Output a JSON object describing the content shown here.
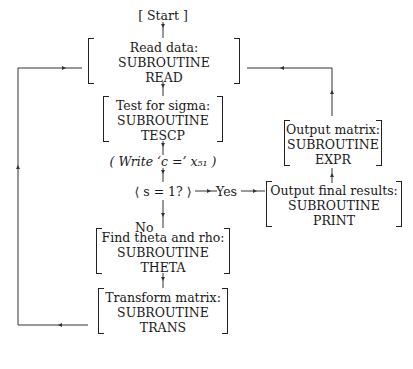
{
  "diagram": {
    "start": "[ Start ]",
    "nodes": [
      {
        "id": "read",
        "lines": [
          "Read data:",
          "SUBROUTINE",
          "READ"
        ]
      },
      {
        "id": "tescp",
        "lines": [
          "Test for sigma:",
          "SUBROUTINE",
          "TESCP"
        ]
      },
      {
        "id": "write",
        "text": "( Write ‘c =’ x₅₁ )"
      },
      {
        "id": "decision",
        "text": "⟨ s = 1? ⟩"
      },
      {
        "id": "theta",
        "lines": [
          "Find theta and rho:",
          "SUBROUTINE",
          "THETA"
        ]
      },
      {
        "id": "trans",
        "lines": [
          "Transform matrix:",
          "SUBROUTINE",
          "TRANS"
        ]
      },
      {
        "id": "print",
        "lines": [
          "Output final results:",
          "SUBROUTINE",
          "PRINT"
        ]
      },
      {
        "id": "expr",
        "lines": [
          "Output matrix:",
          "SUBROUTINE",
          "EXPR"
        ]
      }
    ],
    "edge_labels": {
      "yes": "Yes",
      "no": "No"
    }
  }
}
